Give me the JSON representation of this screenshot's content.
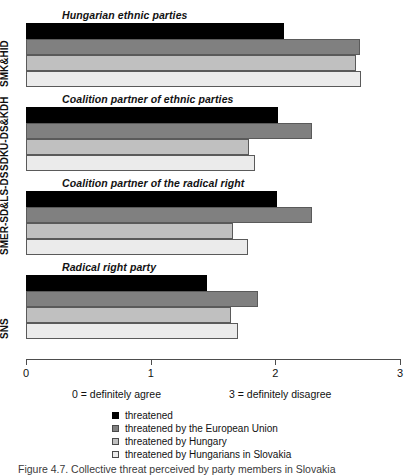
{
  "chart_data": {
    "type": "bar",
    "orientation": "horizontal",
    "title": "",
    "xlabel": "",
    "ylabel": "",
    "xlim": [
      0,
      3
    ],
    "xticks": [
      "0",
      "1",
      "2",
      "3"
    ],
    "grid": false,
    "legend_position": "bottom",
    "axis_notes": {
      "left": "0 = definitely agree",
      "right": "3 = definitely disagree"
    },
    "categories": [
      "SMK&HID",
      "SDKU-DS&KDH",
      "SMER-SD&LS-DS",
      "SNS"
    ],
    "group_titles": [
      "Hungarian ethnic parties",
      "Coalition partner of ethnic parties",
      "Coalition partner of the radical right",
      "Radical right party"
    ],
    "series": [
      {
        "name": "threatened",
        "color": "#000000",
        "values": [
          2.07,
          2.02,
          2.01,
          1.45
        ]
      },
      {
        "name": "threatened by the European Union",
        "color": "#808080",
        "values": [
          2.68,
          2.29,
          2.29,
          1.86
        ]
      },
      {
        "name": "threatened by Hungary",
        "color": "#c0c0c0",
        "values": [
          2.65,
          1.79,
          1.66,
          1.64
        ]
      },
      {
        "name": "threatened by Hungarians in Slovakia",
        "color": "#ebebeb",
        "values": [
          2.69,
          1.84,
          1.78,
          1.7
        ]
      }
    ]
  },
  "caption": "Figure 4.7. Collective threat perceived by party members in Slovakia"
}
